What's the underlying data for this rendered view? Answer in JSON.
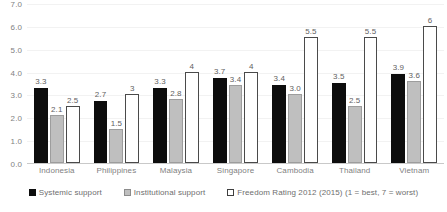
{
  "chart_data": {
    "type": "bar",
    "title": "",
    "subtitle": "",
    "xlabel": "",
    "ylabel": "",
    "categories": [
      "Indonesia",
      "Philippines",
      "Malaysia",
      "Singapore",
      "Cambodia",
      "Thailand",
      "Vietnam"
    ],
    "series": [
      {
        "name": "Systemic support",
        "color": "#0d0d0d",
        "values": [
          3.3,
          2.7,
          3.3,
          3.7,
          3.4,
          3.5,
          3.9
        ],
        "labels": [
          "3.3",
          "2.7",
          "3.3",
          "3.7",
          "3.4",
          "3.5",
          "3.9"
        ]
      },
      {
        "name": "Institutional support",
        "color": "#bfbfbf",
        "values": [
          2.1,
          1.5,
          2.8,
          3.4,
          3.0,
          2.5,
          3.6
        ],
        "labels": [
          "2.1",
          "1.5",
          "2.8",
          "3.4",
          "3.0",
          "2.5",
          "3.6"
        ]
      },
      {
        "name": "Freedom Rating 2012 (2015) (1 = best, 7 = worst)",
        "color": "#ffffff",
        "values": [
          2.5,
          3,
          4,
          4,
          5.5,
          5.5,
          6
        ],
        "labels": [
          "2.5",
          "3",
          "4",
          "4",
          "5.5",
          "5.5",
          "6"
        ]
      }
    ],
    "ylim": [
      0,
      7
    ],
    "ytick_step": 1,
    "ytick_labels": [
      "7.0",
      "6.0",
      "5.0",
      "4.0",
      "3.0",
      "2.0",
      "1.0",
      "0.0"
    ],
    "grid": true,
    "legend_position": "bottom"
  },
  "legend": {
    "items": [
      {
        "label": "Systemic support"
      },
      {
        "label": "Institutional support"
      },
      {
        "label": "Freedom Rating 2012 (2015) (1 = best, 7 = worst)"
      }
    ]
  }
}
